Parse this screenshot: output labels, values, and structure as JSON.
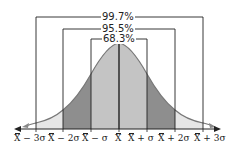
{
  "diagram": {
    "intervals": [
      {
        "label": "99.7%",
        "range": "±3σ"
      },
      {
        "label": "95.5%",
        "range": "±2σ"
      },
      {
        "label": "68.3%",
        "range": "±1σ"
      }
    ],
    "axis_labels": [
      {
        "sym": "X",
        "rest": " − 3σ"
      },
      {
        "sym": "X",
        "rest": " − 2σ"
      },
      {
        "sym": "X",
        "rest": " − σ"
      },
      {
        "sym": "X",
        "rest": ""
      },
      {
        "sym": "X",
        "rest": " + σ"
      },
      {
        "sym": "X",
        "rest": " + 2σ"
      },
      {
        "sym": "X",
        "rest": " + 3σ"
      }
    ],
    "colors": {
      "region_1sigma": "#c4c4c4",
      "region_2sigma": "#8e8e8e",
      "region_3sigma": "#e6e6e6",
      "line": "#222222",
      "curve": "#777777"
    }
  }
}
